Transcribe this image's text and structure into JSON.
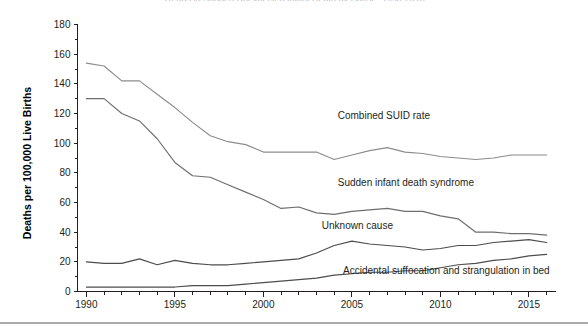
{
  "figure": {
    "title_clipped": "Trends in Sudden Unexpected Infant Death by Cause, 1990-2016",
    "ylabel": "Deaths per 100,000 Live Births"
  },
  "chart_data": {
    "type": "line",
    "title": "",
    "xlabel": "",
    "ylabel": "Deaths per 100,000 Live Births",
    "xlim": [
      1989.5,
      2016.5
    ],
    "ylim": [
      0,
      180
    ],
    "ytick_values": [
      0,
      20,
      40,
      60,
      80,
      100,
      120,
      140,
      160,
      180
    ],
    "ytick_labels": [
      "0",
      "20",
      "40",
      "60",
      "80",
      "100",
      "120",
      "140",
      "160",
      "180"
    ],
    "y_minor_step": 10,
    "xtick_values": [
      1990,
      1995,
      2000,
      2005,
      2010,
      2015
    ],
    "xtick_labels": [
      "1990",
      "1995",
      "2000",
      "2005",
      "2010",
      "2015"
    ],
    "x_minor_step": 1,
    "grid": false,
    "legend_position": "inline-annotations",
    "x": [
      1990,
      1991,
      1992,
      1993,
      1994,
      1995,
      1996,
      1997,
      1998,
      1999,
      2000,
      2001,
      2002,
      2003,
      2004,
      2005,
      2006,
      2007,
      2008,
      2009,
      2010,
      2011,
      2012,
      2013,
      2014,
      2015,
      2016
    ],
    "series": [
      {
        "name": "Combined SUID rate",
        "color": "#8c8c8c",
        "label_x": 2004.2,
        "label_y": 116,
        "values": [
          154,
          152,
          142,
          142,
          133,
          124,
          114,
          105,
          101,
          99,
          94,
          94,
          94,
          94,
          89,
          92,
          95,
          97,
          94,
          93,
          91,
          90,
          89,
          90,
          92,
          92,
          92
        ]
      },
      {
        "name": "Sudden infant death syndrome",
        "color": "#6e6e6e",
        "label_x": 2004.2,
        "label_y": 71,
        "values": [
          130,
          130,
          120,
          115,
          103,
          87,
          78,
          77,
          72,
          67,
          62,
          56,
          57,
          53,
          52,
          54,
          55,
          56,
          54,
          54,
          51,
          49,
          40,
          40,
          39,
          39,
          38
        ]
      },
      {
        "name": "Unknown cause",
        "color": "#4d4d4d",
        "label_x": 2003.3,
        "label_y": 42,
        "values": [
          20,
          19,
          19,
          22,
          18,
          21,
          19,
          18,
          18,
          19,
          20,
          21,
          22,
          26,
          31,
          34,
          32,
          31,
          30,
          28,
          29,
          31,
          31,
          33,
          34,
          35,
          33
        ]
      },
      {
        "name": "Accidental suffocation and strangulation in bed",
        "color": "#4d4d4d",
        "label_x": 2004.5,
        "label_y": 12,
        "values": [
          3,
          3,
          3,
          3,
          3,
          3,
          4,
          4,
          4,
          5,
          6,
          7,
          8,
          9,
          11,
          12,
          13,
          13,
          14,
          14,
          16,
          18,
          19,
          21,
          22,
          24,
          25
        ]
      }
    ]
  }
}
